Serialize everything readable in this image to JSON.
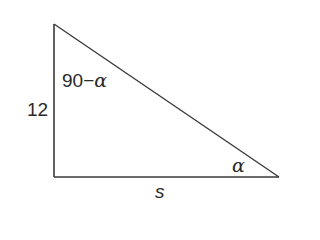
{
  "diagram": {
    "type": "right-triangle",
    "vertices": {
      "top": [
        54,
        24
      ],
      "right_angle": [
        54,
        177
      ],
      "right": [
        279,
        177
      ]
    },
    "stroke_color": "#3a3a3a",
    "sides": {
      "vertical": {
        "label": "12"
      },
      "horizontal": {
        "label": "s"
      }
    },
    "angles": {
      "top": {
        "prefix": "90−",
        "symbol": "α"
      },
      "right": {
        "symbol": "α"
      }
    }
  }
}
